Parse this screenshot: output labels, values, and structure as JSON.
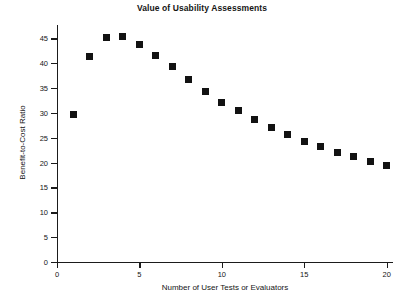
{
  "chart_data": {
    "type": "scatter",
    "title": "Value of Usability Assessments",
    "xlabel": "Number of User Tests or Evaluators",
    "ylabel": "Benefit-to-Cost Ratio",
    "xlim": [
      0,
      20.2
    ],
    "ylim": [
      0,
      46
    ],
    "xticks": [
      0,
      5,
      10,
      15,
      20
    ],
    "xtick_labels": [
      "0",
      "5",
      "10",
      "15",
      "20"
    ],
    "yticks": [
      0,
      5,
      10,
      15,
      20,
      25,
      30,
      35,
      40,
      45
    ],
    "ytick_labels": [
      "0",
      "5",
      "10",
      "15",
      "20",
      "25",
      "30",
      "35",
      "40",
      "45"
    ],
    "grid": false,
    "legend": false,
    "marker": "square",
    "marker_color": "#121212",
    "x": [
      1,
      2,
      3,
      4,
      5,
      6,
      7,
      8,
      9,
      10,
      11,
      12,
      13,
      14,
      15,
      16,
      17,
      18,
      19,
      20
    ],
    "values": [
      29.6,
      41.4,
      45.1,
      45.3,
      43.8,
      41.6,
      39.3,
      36.7,
      34.3,
      32.2,
      30.4,
      28.6,
      27.1,
      25.6,
      24.3,
      23.3,
      22.0,
      21.2,
      20.2,
      19.4
    ],
    "series": [
      {
        "name": "Benefit-to-Cost Ratio",
        "values": [
          29.6,
          41.4,
          45.1,
          45.3,
          43.8,
          41.6,
          39.3,
          36.7,
          34.3,
          32.2,
          30.4,
          28.6,
          27.1,
          25.6,
          24.3,
          23.3,
          22.0,
          21.2,
          20.2,
          19.4
        ]
      }
    ],
    "annotations": []
  },
  "figure": {
    "background": "#ffffff",
    "axis_color": "#1b1b1b",
    "text_color": "#151515"
  },
  "caption": {
    "text": ""
  }
}
